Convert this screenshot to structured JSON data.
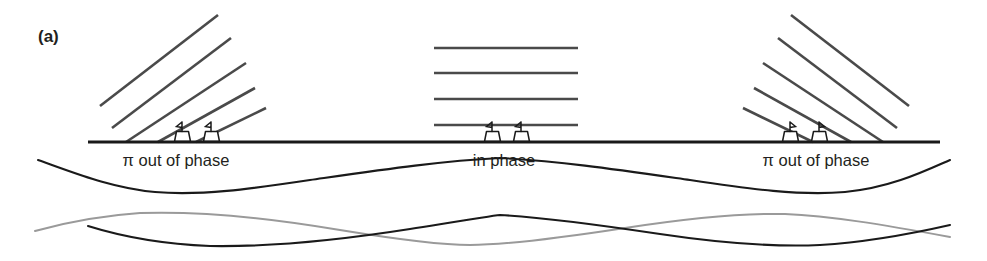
{
  "figure": {
    "panel_label": "(a)",
    "background_color": "#ffffff",
    "width": 987,
    "height": 261
  },
  "colors": {
    "wavefront": "#4a4a4a",
    "baseline": "#1a1a1a",
    "wave_primary": "#1a1a1a",
    "wave_secondary": "#9a9a9a",
    "text": "#231f20"
  },
  "regions": [
    {
      "id": "left",
      "label": "π out of phase",
      "label_x": 176,
      "label_y": 166,
      "wavefront_type": "diagonal-up-right",
      "wavefront_count": 5,
      "ship_count": 2
    },
    {
      "id": "center",
      "label": "in phase",
      "label_x": 504,
      "label_y": 166,
      "wavefront_type": "horizontal",
      "wavefront_count": 4,
      "ship_count": 2
    },
    {
      "id": "right",
      "label": "π out of phase",
      "label_x": 816,
      "label_y": 166,
      "wavefront_type": "diagonal-down-right",
      "wavefront_count": 5,
      "ship_count": 2
    }
  ],
  "baseline": {
    "x1": 88,
    "x2": 940,
    "y": 142
  },
  "wavefronts": {
    "left": [
      {
        "x1": 100,
        "y1": 106,
        "x2": 218,
        "y2": 15
      },
      {
        "x1": 112,
        "y1": 128,
        "x2": 231,
        "y2": 38
      },
      {
        "x1": 126,
        "y1": 142,
        "x2": 246,
        "y2": 63
      },
      {
        "x1": 158,
        "y1": 142,
        "x2": 255,
        "y2": 88
      },
      {
        "x1": 196,
        "y1": 142,
        "x2": 266,
        "y2": 108
      }
    ],
    "center": [
      {
        "x1": 434,
        "y1": 48,
        "x2": 578,
        "y2": 48
      },
      {
        "x1": 434,
        "y1": 73,
        "x2": 578,
        "y2": 73
      },
      {
        "x1": 434,
        "y1": 99,
        "x2": 578,
        "y2": 99
      },
      {
        "x1": 434,
        "y1": 125,
        "x2": 578,
        "y2": 125
      }
    ],
    "right": [
      {
        "x1": 791,
        "y1": 15,
        "x2": 909,
        "y2": 106
      },
      {
        "x1": 778,
        "y1": 38,
        "x2": 897,
        "y2": 128
      },
      {
        "x1": 763,
        "y1": 63,
        "x2": 883,
        "y2": 142
      },
      {
        "x1": 754,
        "y1": 88,
        "x2": 851,
        "y2": 142
      },
      {
        "x1": 743,
        "y1": 108,
        "x2": 813,
        "y2": 142
      }
    ]
  },
  "ships": [
    {
      "cx": 182,
      "region": "left"
    },
    {
      "cx": 211,
      "region": "left"
    },
    {
      "cx": 492,
      "region": "center"
    },
    {
      "cx": 521,
      "region": "center"
    },
    {
      "cx": 790,
      "region": "right"
    },
    {
      "cx": 819,
      "region": "right"
    }
  ],
  "waves": {
    "upper": {
      "name": "resultant-wave",
      "color": "#1a1a1a",
      "baseline_y": 176,
      "amplitude": 18,
      "x_start": 38,
      "x_end": 950,
      "crest_x": 500,
      "trough_left_x": 200,
      "trough_right_x": 800
    },
    "lower_dark": {
      "name": "component-wave-a",
      "color": "#1a1a1a",
      "baseline_y": 228,
      "amplitude": 17,
      "x_start": 88,
      "x_end": 950,
      "crest_x": 500
    },
    "lower_gray": {
      "name": "component-wave-b",
      "color": "#9a9a9a",
      "baseline_y": 228,
      "amplitude": 17,
      "x_start": 35,
      "x_end": 950,
      "crest_x": 470
    }
  }
}
